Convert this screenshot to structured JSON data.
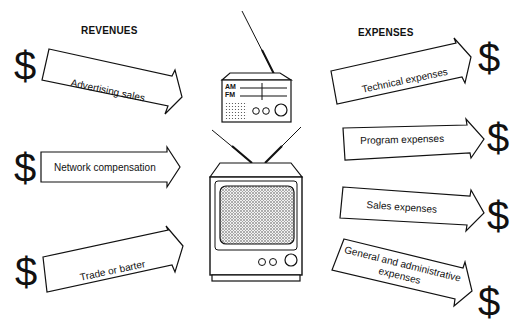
{
  "revenues": {
    "heading": "REVENUES",
    "items": [
      {
        "label": "Advertising sales",
        "icon": "dollar-sign"
      },
      {
        "label": "Network compensation",
        "icon": "dollar-sign"
      },
      {
        "label": "Trade or barter",
        "icon": "dollar-sign"
      }
    ]
  },
  "expenses": {
    "heading": "EXPENSES",
    "items": [
      {
        "label": "Technical expenses",
        "icon": "dollar-sign"
      },
      {
        "label": "Program expenses",
        "icon": "dollar-sign"
      },
      {
        "label": "Sales expenses",
        "icon": "dollar-sign"
      },
      {
        "label": "General and administrative",
        "label2": "expenses",
        "icon": "dollar-sign"
      }
    ]
  },
  "radio": {
    "am_label": "AM",
    "fm_label": "FM"
  },
  "dollar_glyph": "$"
}
